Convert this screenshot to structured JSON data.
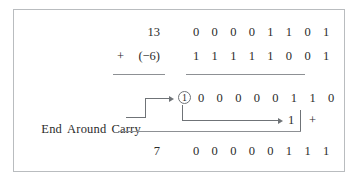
{
  "figure": {
    "rows": {
      "augend": {
        "decimal": "13",
        "binary": "0 0 0 0 1 1 0 1"
      },
      "addend": {
        "sign_label": "+",
        "decimal": "(−6)",
        "binary": "1 1 1 1 1 0 0 1"
      },
      "intermediate": {
        "carry_out": "1",
        "binary": "0 0 0 0 0 1 1 0"
      },
      "carry_add": {
        "value": "1",
        "operator": "+"
      },
      "result": {
        "decimal": "7",
        "binary": "0 0 0 0 0 1 1 1"
      }
    },
    "annotation": {
      "end_around_carry_label": [
        "End",
        "Around",
        "Carry"
      ]
    },
    "colors": {
      "frame": "#b9bcbf",
      "rule": "#8d9094",
      "connector": "#6f7377",
      "text": "#2b2b2b",
      "background": "#ffffff"
    }
  }
}
